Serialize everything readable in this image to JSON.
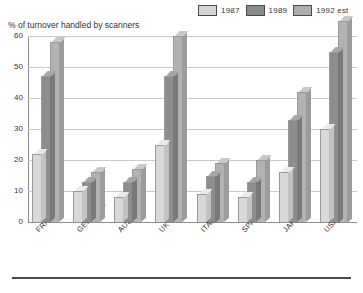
{
  "chart_data": {
    "type": "bar",
    "title": "% of turnover handled by scanners",
    "xlabel": "",
    "ylabel": "",
    "ylim": [
      0,
      60
    ],
    "yticks": [
      0,
      10,
      20,
      30,
      40,
      50,
      60
    ],
    "grid": true,
    "legend_position": "top-right",
    "style": "3d-bar",
    "categories": [
      "FRANCE",
      "GERMANY",
      "AUSTRIA",
      "UK",
      "ITALY",
      "SPAIN",
      "JAPAN",
      "USA"
    ],
    "series": [
      {
        "name": "1987",
        "color": "#d8d8d8",
        "values": [
          22,
          10,
          8,
          25,
          9,
          8,
          16,
          30
        ]
      },
      {
        "name": "1989",
        "color": "#8d8d8d",
        "values": [
          47,
          13,
          13,
          47,
          15,
          13,
          33,
          55
        ]
      },
      {
        "name": "1992 est",
        "color": "#b2b2b2",
        "values": [
          58,
          16,
          17,
          60,
          19,
          20,
          42,
          65
        ]
      }
    ]
  },
  "legend": {
    "items": [
      {
        "label": "1987"
      },
      {
        "label": "1989"
      },
      {
        "label": "1992 est"
      }
    ]
  }
}
